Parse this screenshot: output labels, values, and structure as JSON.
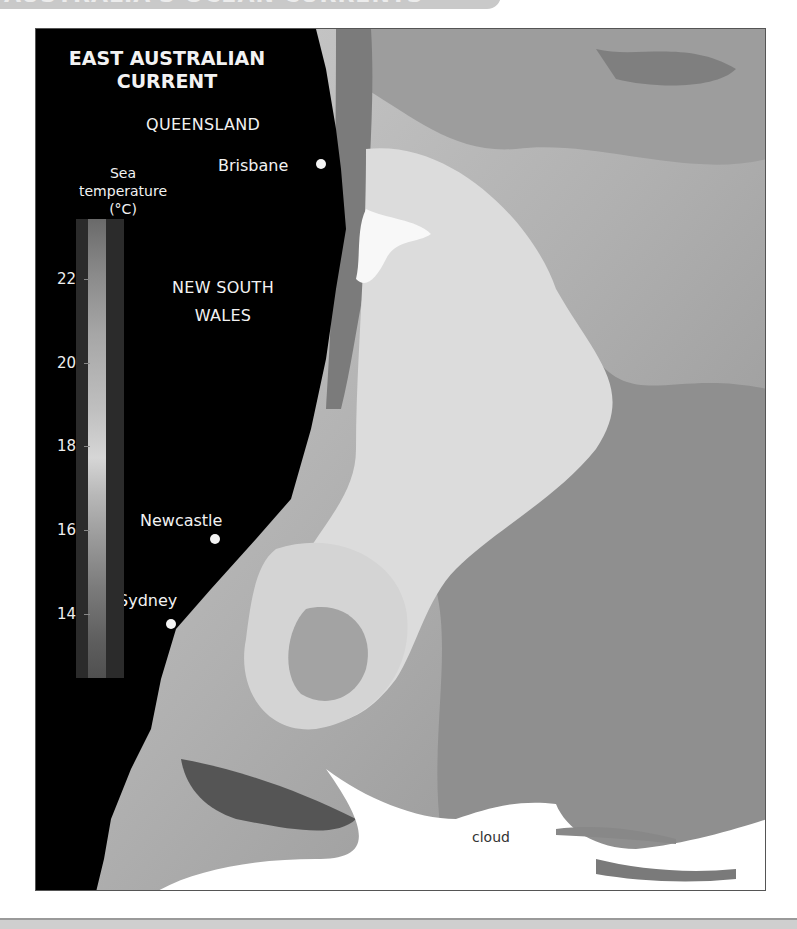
{
  "banner": {
    "text": "AUSTRALIA'S OCEAN CURRENTS"
  },
  "map": {
    "title_line1": "EAST AUSTRALIAN",
    "title_line2": "CURRENT",
    "regions": {
      "queensland": "QUEENSLAND",
      "nsw_line1": "NEW SOUTH",
      "nsw_line2": "WALES"
    },
    "cities": [
      {
        "name": "Brisbane"
      },
      {
        "name": "Newcastle"
      },
      {
        "name": "Sydney"
      }
    ],
    "cloud_label": "cloud",
    "colors": {
      "land": "#000000",
      "cloud": "#ffffff",
      "warm_water": "#d8d8d8",
      "cool_water": "#8a8a8a"
    }
  },
  "legend": {
    "title_line1": "Sea",
    "title_line2": "temperature",
    "title_line3": "(°C)",
    "ticks": [
      "22",
      "20",
      "18",
      "16",
      "14"
    ],
    "range": [
      13,
      23
    ]
  }
}
